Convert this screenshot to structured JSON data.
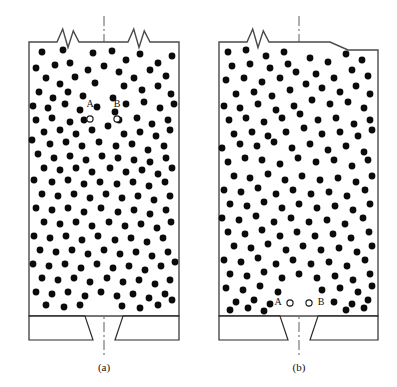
{
  "figure": {
    "type": "engineering-cross-section",
    "background_color": "#ffffff",
    "particle_color": "#0b0b0b",
    "wall_color": "#4a4a4a",
    "hatch_color": "#2b2b2b",
    "centerline_color": "#4a4a4a",
    "particle_radius": 3.4,
    "tracer_radius": 3.1
  },
  "panels": [
    {
      "id": "a",
      "caption": "(a)",
      "caption_x": 104,
      "caption_y": 371,
      "body": {
        "x": 29,
        "y": 42,
        "width": 150,
        "height": 274
      },
      "hopper": {
        "y": 316,
        "height": 24
      },
      "outlet": {
        "left": 93,
        "right": 115,
        "top_left": 85,
        "top_right": 123
      },
      "centerline": {
        "x": 104,
        "y1": 16,
        "y2": 358
      },
      "breaks": [
        {
          "x": 57,
          "y": 42,
          "width": 22
        },
        {
          "x": 128,
          "y": 42,
          "width": 22
        }
      ],
      "tracers": [
        {
          "name": "A",
          "label": "A",
          "cx": 90,
          "cy": 119,
          "label_x": 90,
          "label_y": 105,
          "label_position": "above"
        },
        {
          "name": "B",
          "label": "B",
          "cx": 117,
          "cy": 119,
          "label_x": 117,
          "label_y": 105,
          "label_position": "above"
        }
      ]
    },
    {
      "id": "b",
      "caption": "(b)",
      "caption_x": 299,
      "caption_y": 371,
      "body": {
        "x": 219,
        "y": 42,
        "width": 159,
        "height": 274
      },
      "hopper": {
        "y": 316,
        "height": 24
      },
      "outlet": {
        "left": 288,
        "right": 310,
        "top_left": 280,
        "top_right": 318
      },
      "centerline": {
        "x": 299,
        "y1": 16,
        "y2": 358
      },
      "breaks": [
        {
          "x": 247,
          "y": 42,
          "width": 22
        }
      ],
      "corner_notch": {
        "x": 330,
        "y": 42,
        "width": 18,
        "height": 8
      },
      "tracers": [
        {
          "name": "A",
          "label": "A",
          "cx": 290,
          "cy": 303,
          "label_x": 278,
          "label_y": 303,
          "label_position": "left"
        },
        {
          "name": "B",
          "label": "B",
          "cx": 309,
          "cy": 303,
          "label_x": 321,
          "label_y": 303,
          "label_position": "right"
        }
      ]
    }
  ],
  "particles": {
    "panel_a": [
      [
        42,
        52
      ],
      [
        63,
        50
      ],
      [
        93,
        53
      ],
      [
        36,
        68
      ],
      [
        55,
        65
      ],
      [
        70,
        63
      ],
      [
        88,
        70
      ],
      [
        104,
        66
      ],
      [
        46,
        78
      ],
      [
        75,
        77
      ],
      [
        60,
        84
      ],
      [
        95,
        83
      ],
      [
        39,
        92
      ],
      [
        68,
        92
      ],
      [
        53,
        98
      ],
      [
        83,
        96
      ],
      [
        112,
        51
      ],
      [
        126,
        60
      ],
      [
        140,
        54
      ],
      [
        158,
        63
      ],
      [
        172,
        56
      ],
      [
        119,
        72
      ],
      [
        134,
        78
      ],
      [
        150,
        70
      ],
      [
        166,
        76
      ],
      [
        124,
        86
      ],
      [
        142,
        90
      ],
      [
        158,
        86
      ],
      [
        171,
        94
      ],
      [
        113,
        98
      ],
      [
        33,
        106
      ],
      [
        48,
        108
      ],
      [
        65,
        104
      ],
      [
        80,
        110
      ],
      [
        97,
        107
      ],
      [
        126,
        104
      ],
      [
        144,
        102
      ],
      [
        160,
        108
      ],
      [
        174,
        104
      ],
      [
        115,
        112
      ],
      [
        36,
        120
      ],
      [
        52,
        118
      ],
      [
        70,
        122
      ],
      [
        84,
        120
      ],
      [
        119,
        120
      ],
      [
        137,
        118
      ],
      [
        152,
        124
      ],
      [
        168,
        120
      ],
      [
        44,
        132
      ],
      [
        60,
        130
      ],
      [
        76,
        134
      ],
      [
        92,
        130
      ],
      [
        108,
        126
      ],
      [
        124,
        134
      ],
      [
        140,
        132
      ],
      [
        156,
        136
      ],
      [
        170,
        130
      ],
      [
        32,
        140
      ],
      [
        50,
        144
      ],
      [
        66,
        142
      ],
      [
        82,
        146
      ],
      [
        99,
        142
      ],
      [
        116,
        146
      ],
      [
        132,
        144
      ],
      [
        148,
        150
      ],
      [
        164,
        146
      ],
      [
        38,
        154
      ],
      [
        54,
        158
      ],
      [
        70,
        156
      ],
      [
        86,
        160
      ],
      [
        102,
        156
      ],
      [
        118,
        158
      ],
      [
        134,
        160
      ],
      [
        150,
        162
      ],
      [
        166,
        158
      ],
      [
        44,
        168
      ],
      [
        60,
        170
      ],
      [
        76,
        168
      ],
      [
        92,
        172
      ],
      [
        110,
        168
      ],
      [
        126,
        172
      ],
      [
        142,
        170
      ],
      [
        158,
        174
      ],
      [
        172,
        168
      ],
      [
        34,
        180
      ],
      [
        52,
        182
      ],
      [
        68,
        180
      ],
      [
        84,
        184
      ],
      [
        100,
        182
      ],
      [
        117,
        184
      ],
      [
        133,
        182
      ],
      [
        149,
        186
      ],
      [
        165,
        182
      ],
      [
        42,
        194
      ],
      [
        58,
        196
      ],
      [
        74,
        194
      ],
      [
        90,
        198
      ],
      [
        106,
        194
      ],
      [
        122,
        198
      ],
      [
        138,
        196
      ],
      [
        154,
        200
      ],
      [
        170,
        196
      ],
      [
        36,
        208
      ],
      [
        52,
        210
      ],
      [
        68,
        208
      ],
      [
        84,
        212
      ],
      [
        101,
        208
      ],
      [
        118,
        212
      ],
      [
        134,
        210
      ],
      [
        150,
        214
      ],
      [
        166,
        210
      ],
      [
        44,
        222
      ],
      [
        60,
        224
      ],
      [
        76,
        222
      ],
      [
        92,
        226
      ],
      [
        109,
        222
      ],
      [
        125,
        226
      ],
      [
        141,
        224
      ],
      [
        157,
        228
      ],
      [
        171,
        222
      ],
      [
        34,
        236
      ],
      [
        50,
        238
      ],
      [
        66,
        236
      ],
      [
        82,
        240
      ],
      [
        98,
        236
      ],
      [
        115,
        240
      ],
      [
        131,
        238
      ],
      [
        147,
        242
      ],
      [
        163,
        238
      ],
      [
        40,
        250
      ],
      [
        56,
        252
      ],
      [
        72,
        250
      ],
      [
        88,
        254
      ],
      [
        104,
        250
      ],
      [
        120,
        254
      ],
      [
        136,
        252
      ],
      [
        152,
        256
      ],
      [
        168,
        252
      ],
      [
        33,
        264
      ],
      [
        49,
        266
      ],
      [
        65,
        264
      ],
      [
        81,
        268
      ],
      [
        97,
        264
      ],
      [
        113,
        268
      ],
      [
        129,
        266
      ],
      [
        145,
        270
      ],
      [
        161,
        266
      ],
      [
        175,
        262
      ],
      [
        42,
        278
      ],
      [
        58,
        280
      ],
      [
        74,
        278
      ],
      [
        90,
        282
      ],
      [
        107,
        278
      ],
      [
        123,
        282
      ],
      [
        139,
        280
      ],
      [
        155,
        284
      ],
      [
        170,
        280
      ],
      [
        36,
        292
      ],
      [
        52,
        294
      ],
      [
        68,
        292
      ],
      [
        85,
        296
      ],
      [
        101,
        292
      ],
      [
        117,
        296
      ],
      [
        133,
        294
      ],
      [
        149,
        298
      ],
      [
        165,
        294
      ],
      [
        46,
        305
      ],
      [
        64,
        307
      ],
      [
        80,
        305
      ],
      [
        122,
        306
      ],
      [
        140,
        308
      ],
      [
        158,
        305
      ],
      [
        172,
        300
      ]
    ],
    "panel_b": [
      [
        228,
        52
      ],
      [
        246,
        50
      ],
      [
        266,
        56
      ],
      [
        284,
        52
      ],
      [
        232,
        66
      ],
      [
        250,
        64
      ],
      [
        270,
        68
      ],
      [
        288,
        64
      ],
      [
        226,
        80
      ],
      [
        244,
        78
      ],
      [
        262,
        82
      ],
      [
        280,
        78
      ],
      [
        296,
        72
      ],
      [
        236,
        94
      ],
      [
        254,
        92
      ],
      [
        272,
        96
      ],
      [
        290,
        90
      ],
      [
        306,
        84
      ],
      [
        310,
        58
      ],
      [
        328,
        62
      ],
      [
        346,
        54
      ],
      [
        362,
        60
      ],
      [
        316,
        74
      ],
      [
        334,
        78
      ],
      [
        352,
        70
      ],
      [
        368,
        76
      ],
      [
        322,
        88
      ],
      [
        340,
        92
      ],
      [
        356,
        86
      ],
      [
        370,
        94
      ],
      [
        224,
        106
      ],
      [
        240,
        108
      ],
      [
        258,
        104
      ],
      [
        276,
        110
      ],
      [
        294,
        106
      ],
      [
        312,
        100
      ],
      [
        330,
        104
      ],
      [
        348,
        102
      ],
      [
        364,
        108
      ],
      [
        229,
        120
      ],
      [
        246,
        118
      ],
      [
        264,
        122
      ],
      [
        282,
        118
      ],
      [
        300,
        114
      ],
      [
        318,
        120
      ],
      [
        336,
        118
      ],
      [
        354,
        124
      ],
      [
        370,
        120
      ],
      [
        234,
        134
      ],
      [
        252,
        132
      ],
      [
        268,
        136
      ],
      [
        286,
        132
      ],
      [
        304,
        128
      ],
      [
        322,
        134
      ],
      [
        340,
        132
      ],
      [
        358,
        136
      ],
      [
        372,
        130
      ],
      [
        222,
        148
      ],
      [
        240,
        144
      ],
      [
        257,
        146
      ],
      [
        274,
        142
      ],
      [
        292,
        148
      ],
      [
        310,
        144
      ],
      [
        328,
        150
      ],
      [
        346,
        146
      ],
      [
        364,
        152
      ],
      [
        228,
        162
      ],
      [
        245,
        158
      ],
      [
        262,
        160
      ],
      [
        280,
        164
      ],
      [
        298,
        158
      ],
      [
        316,
        162
      ],
      [
        334,
        160
      ],
      [
        352,
        166
      ],
      [
        368,
        160
      ],
      [
        234,
        176
      ],
      [
        250,
        178
      ],
      [
        268,
        174
      ],
      [
        285,
        180
      ],
      [
        302,
        176
      ],
      [
        320,
        180
      ],
      [
        338,
        178
      ],
      [
        356,
        182
      ],
      [
        372,
        176
      ],
      [
        224,
        190
      ],
      [
        241,
        192
      ],
      [
        258,
        188
      ],
      [
        276,
        194
      ],
      [
        293,
        190
      ],
      [
        311,
        194
      ],
      [
        329,
        192
      ],
      [
        347,
        196
      ],
      [
        365,
        190
      ],
      [
        230,
        204
      ],
      [
        247,
        206
      ],
      [
        264,
        202
      ],
      [
        282,
        208
      ],
      [
        299,
        204
      ],
      [
        317,
        208
      ],
      [
        335,
        206
      ],
      [
        353,
        210
      ],
      [
        370,
        204
      ],
      [
        222,
        218
      ],
      [
        239,
        220
      ],
      [
        256,
        216
      ],
      [
        274,
        222
      ],
      [
        291,
        218
      ],
      [
        309,
        222
      ],
      [
        327,
        220
      ],
      [
        345,
        224
      ],
      [
        363,
        218
      ],
      [
        228,
        232
      ],
      [
        245,
        234
      ],
      [
        262,
        230
      ],
      [
        280,
        236
      ],
      [
        297,
        232
      ],
      [
        315,
        236
      ],
      [
        333,
        234
      ],
      [
        351,
        238
      ],
      [
        369,
        232
      ],
      [
        234,
        246
      ],
      [
        251,
        248
      ],
      [
        268,
        244
      ],
      [
        286,
        250
      ],
      [
        303,
        246
      ],
      [
        321,
        250
      ],
      [
        339,
        248
      ],
      [
        357,
        252
      ],
      [
        372,
        246
      ],
      [
        224,
        260
      ],
      [
        241,
        262
      ],
      [
        258,
        258
      ],
      [
        276,
        264
      ],
      [
        293,
        260
      ],
      [
        311,
        264
      ],
      [
        329,
        262
      ],
      [
        347,
        266
      ],
      [
        365,
        260
      ],
      [
        230,
        274
      ],
      [
        247,
        276
      ],
      [
        264,
        272
      ],
      [
        282,
        278
      ],
      [
        299,
        274
      ],
      [
        317,
        278
      ],
      [
        335,
        276
      ],
      [
        353,
        280
      ],
      [
        370,
        274
      ],
      [
        226,
        288
      ],
      [
        243,
        290
      ],
      [
        260,
        286
      ],
      [
        278,
        292
      ],
      [
        322,
        290
      ],
      [
        340,
        288
      ],
      [
        358,
        292
      ],
      [
        372,
        286
      ],
      [
        236,
        302
      ],
      [
        254,
        300
      ],
      [
        270,
        304
      ],
      [
        334,
        302
      ],
      [
        352,
        304
      ],
      [
        368,
        300
      ],
      [
        230,
        310
      ],
      [
        248,
        308
      ],
      [
        264,
        311
      ],
      [
        346,
        310
      ],
      [
        364,
        308
      ]
    ]
  }
}
